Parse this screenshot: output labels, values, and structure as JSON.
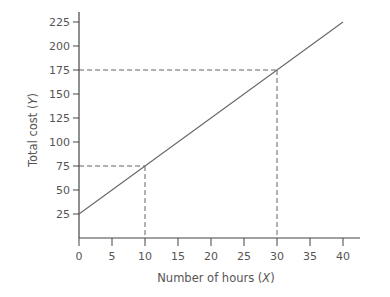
{
  "chart_data": {
    "type": "line",
    "title": "",
    "xlabel": "Number of hours (X)",
    "ylabel": "Total cost (Y)",
    "xlabel_text": "Number of hours (",
    "xlabel_var": "X",
    "ylabel_text": "Total cost (",
    "ylabel_var": "Y",
    "xlim": [
      0,
      44
    ],
    "ylim": [
      0,
      240
    ],
    "x_ticks": [
      0,
      5,
      10,
      15,
      20,
      25,
      30,
      35,
      40
    ],
    "y_ticks": [
      25,
      50,
      75,
      100,
      125,
      150,
      175,
      200,
      225
    ],
    "grid": false,
    "legend": null,
    "series": [
      {
        "name": "Total cost",
        "x": [
          0,
          40
        ],
        "y": [
          25,
          225
        ],
        "equation": "Y = 25 + 5X",
        "color": "#666666"
      }
    ],
    "annotations": [
      {
        "type": "dashed-guide",
        "x": 10,
        "y": 75
      },
      {
        "type": "dashed-guide",
        "x": 30,
        "y": 175
      }
    ]
  }
}
